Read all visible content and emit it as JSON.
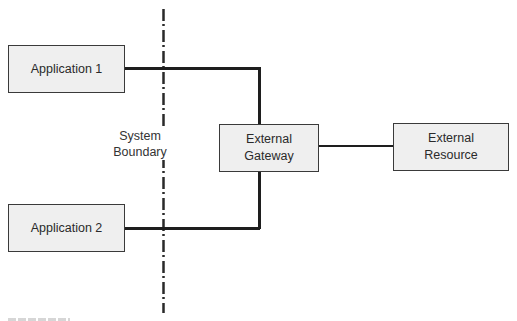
{
  "diagram": {
    "nodes": [
      {
        "id": "app1",
        "label": "Application 1"
      },
      {
        "id": "app2",
        "label": "Application 2"
      },
      {
        "id": "gateway",
        "label_line1": "External",
        "label_line2": "Gateway"
      },
      {
        "id": "resource",
        "label_line1": "External",
        "label_line2": "Resource"
      }
    ],
    "boundary": {
      "label_line1": "System",
      "label_line2": "Boundary"
    },
    "edges": [
      {
        "from": "app1",
        "to": "gateway"
      },
      {
        "from": "app2",
        "to": "gateway"
      },
      {
        "from": "gateway",
        "to": "resource"
      }
    ],
    "colors": {
      "box_fill": "#efefef",
      "box_border": "#3a3a3a",
      "line": "#1e1e1e"
    }
  }
}
